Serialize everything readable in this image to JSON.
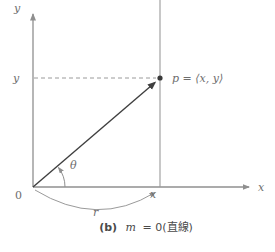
{
  "figure": {
    "axes": {
      "y_axis_label": "y",
      "x_axis_label": "x"
    },
    "coords": {
      "origin_label": "0",
      "y_tick_label": "y",
      "x_tick_label": "x"
    },
    "point_label": "p = ⟨x, y⟩",
    "angle_label": "θ",
    "radius_label": "r",
    "caption": {
      "prefix": "(b)",
      "variable": "m",
      "rest": "= 0(直線)"
    },
    "colors": {
      "axis_line": "#8f8f8f",
      "vector_line": "#3f3f3f",
      "label_text": "#6e6e6e",
      "caption_text": "#4a4a4a"
    }
  }
}
